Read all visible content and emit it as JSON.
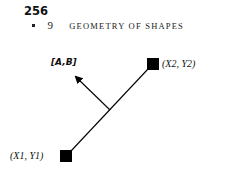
{
  "header": {
    "page_number": "256",
    "chapter_number": "9",
    "chapter_title": "GEOMETRY OF SHAPES"
  },
  "figure": {
    "normal_label": "[A,B]",
    "point2_label": "(X2, Y2)",
    "point1_label": "(X1, Y1)",
    "line_color": "#000000"
  }
}
